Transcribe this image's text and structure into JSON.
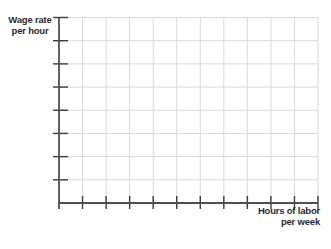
{
  "labels": {
    "y_line1": "Wage rate",
    "y_line2": "per hour",
    "x_line1": "Hours of labor",
    "x_line2": "per week"
  },
  "colors": {
    "background": "#ffffff",
    "grid_line": "#d9d9d9",
    "axis_line": "#4f4f4f",
    "tick_mark": "#3a3a3a",
    "label_text": "#2b2b2b"
  },
  "chart_data": {
    "type": "line",
    "title": "",
    "xlabel": "Hours of labor per week",
    "ylabel": "Wage rate per hour",
    "series": [],
    "categories": [],
    "x_tick_labels": [],
    "y_tick_labels": [],
    "x_gridline_count": 11,
    "y_gridline_count": 8,
    "grid": true,
    "legend": false
  }
}
